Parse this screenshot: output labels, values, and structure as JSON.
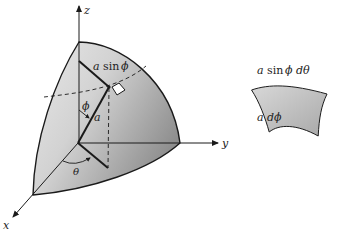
{
  "figure": {
    "type": "spherical-coordinates-surface-element",
    "axes": {
      "x_label": "x",
      "y_label": "y",
      "z_label": "z"
    },
    "angles": {
      "polar": "ϕ",
      "azimuthal": "θ"
    },
    "radius_label": "a",
    "ring_radius_label": {
      "var": "a",
      "fn": "sin",
      "angle": "ϕ"
    },
    "patch": {
      "width_label": {
        "var": "a",
        "fn": "sin",
        "angle": "ϕ",
        "diff": "dθ"
      },
      "height_label": {
        "var": "a",
        "diff": "dϕ"
      }
    },
    "colors": {
      "surface_light": "#e4e4e4",
      "surface_dark": "#9a9a9a",
      "stroke": "#1a1a1a",
      "patch_fill": "#bdbdbd"
    }
  }
}
